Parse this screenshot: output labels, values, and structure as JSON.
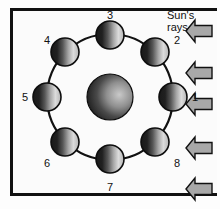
{
  "figure": {
    "sun_rays_label_line1": "Sun's",
    "sun_rays_label_line2": "rays",
    "frame_color": "#111111",
    "arrow_fill": "#a8a8a8",
    "arrow_stroke": "#111111",
    "orbit_stroke": "#111111",
    "background": "#fbfbfb"
  },
  "central_body": {
    "name": "earth",
    "cx": 110,
    "cy": 97,
    "r": 23,
    "lit_side": "right",
    "dark_color": "#1d1d1d",
    "light_color": "#cfcfcf"
  },
  "orbit": {
    "cx": 110,
    "cy": 97,
    "r": 63,
    "stroke_width": 2.2
  },
  "moons": [
    {
      "label": "1",
      "angle_deg": 0,
      "cx": 173,
      "cy": 97,
      "r": 14,
      "label_x": 192,
      "label_y": 92
    },
    {
      "label": "2",
      "angle_deg": 45,
      "cx": 155,
      "cy": 52,
      "r": 14,
      "label_x": 174,
      "label_y": 35
    },
    {
      "label": "3",
      "angle_deg": 90,
      "cx": 110,
      "cy": 35,
      "r": 14,
      "label_x": 107,
      "label_y": 10
    },
    {
      "label": "4",
      "angle_deg": 135,
      "cx": 65,
      "cy": 52,
      "r": 14,
      "label_x": 44,
      "label_y": 35
    },
    {
      "label": "5",
      "angle_deg": 180,
      "cx": 47,
      "cy": 97,
      "r": 14,
      "label_x": 22,
      "label_y": 92
    },
    {
      "label": "6",
      "angle_deg": 225,
      "cx": 65,
      "cy": 142,
      "r": 14,
      "label_x": 44,
      "label_y": 158
    },
    {
      "label": "7",
      "angle_deg": 270,
      "cx": 110,
      "cy": 159,
      "r": 14,
      "label_x": 107,
      "label_y": 182
    },
    {
      "label": "8",
      "angle_deg": 315,
      "cx": 155,
      "cy": 142,
      "r": 14,
      "label_x": 174,
      "label_y": 158
    }
  ],
  "sun_arrows": [
    {
      "name": "sun-ray-arrow-1",
      "tip_x": 186,
      "tip_y": 31
    },
    {
      "name": "sun-ray-arrow-2",
      "tip_x": 186,
      "tip_y": 73
    },
    {
      "name": "sun-ray-arrow-3",
      "tip_x": 186,
      "tip_y": 104
    },
    {
      "name": "sun-ray-arrow-4",
      "tip_x": 186,
      "tip_y": 148
    },
    {
      "name": "sun-ray-arrow-5",
      "tip_x": 186,
      "tip_y": 189
    }
  ]
}
